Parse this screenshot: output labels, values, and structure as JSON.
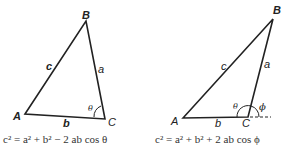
{
  "left_triangle": {
    "vertices": {
      "A": "A",
      "B": "B",
      "C": "C"
    },
    "sides": {
      "a": "a",
      "b": "b",
      "c": "c"
    },
    "angle": "θ",
    "formula": "c² = a² + b² − 2 ab cos θ"
  },
  "right_triangle": {
    "vertices": {
      "A": "A",
      "B": "B",
      "C": "C"
    },
    "sides": {
      "a": "a",
      "b": "b",
      "c": "c"
    },
    "angles": {
      "interior": "θ",
      "exterior": "ϕ"
    },
    "formula": "c² = a² + b² + 2 ab cos ϕ"
  }
}
